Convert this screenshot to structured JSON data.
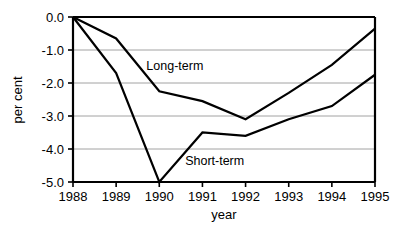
{
  "chart_data": {
    "type": "line",
    "title": "",
    "subtitle": "",
    "xlabel": "year",
    "ylabel": "per cent",
    "categories": [
      1988,
      1989,
      1990,
      1991,
      1992,
      1993,
      1994,
      1995
    ],
    "x_tick_labels": [
      "1988",
      "1989",
      "1990",
      "1991",
      "1992",
      "1993",
      "1994",
      "1995"
    ],
    "y_tick_labels": [
      "0.0",
      "-1.0",
      "-2.0",
      "-3.0",
      "-4.0",
      "-5.0"
    ],
    "y_tick_values": [
      0.0,
      -1.0,
      -2.0,
      -3.0,
      -4.0,
      -5.0
    ],
    "xlim": [
      1988,
      1995
    ],
    "ylim": [
      -5.0,
      0.0
    ],
    "grid": "horizontal",
    "legend_position": "inline-annotation",
    "series": [
      {
        "name": "Long-term",
        "color": "#000000",
        "values": [
          0.0,
          -0.65,
          -2.25,
          -2.55,
          -3.1,
          -2.3,
          -1.45,
          -0.35
        ]
      },
      {
        "name": "Short-term",
        "color": "#000000",
        "values": [
          0.0,
          -1.7,
          -5.0,
          -3.5,
          -3.6,
          -3.1,
          -2.7,
          -1.75
        ]
      }
    ],
    "annotations": [
      {
        "text": "Long-term",
        "x": 1989.7,
        "y": -1.62
      },
      {
        "text": "Short-term",
        "x": 1990.6,
        "y": -4.48
      }
    ]
  }
}
